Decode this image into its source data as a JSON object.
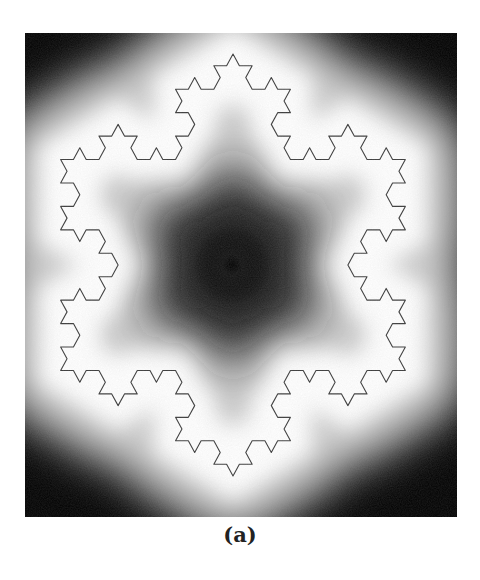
{
  "figure": {
    "caption": "(a)",
    "koch_level": 3,
    "colors": {
      "curve": "#3a3a3a",
      "near": "#ffffff",
      "far": "#000000"
    }
  }
}
